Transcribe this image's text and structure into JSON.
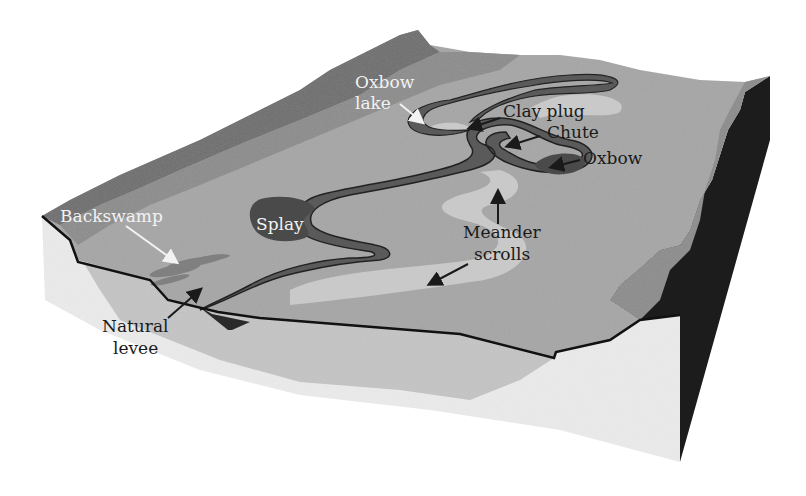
{
  "figure": {
    "labels": {
      "oxbow_lake_line1": "Oxbow",
      "oxbow_lake_line2": "lake",
      "clay_plug": "Clay plug",
      "chute": "Chute",
      "oxbow": "Oxbow",
      "backswamp": "Backswamp",
      "splay": "Splay",
      "meander_line1": "Meander",
      "meander_line2": "scrolls",
      "natural_line1": "Natural",
      "natural_line2": "levee"
    },
    "colors": {
      "background": "#ffffff",
      "valley_wall": "#6e6e6e",
      "floodplain_outer": "#8c8c8c",
      "floodplain": "#a6a6a6",
      "channel": "#5a5a5a",
      "point_bar": "#c9c9c9",
      "front_face": "#ebebeb",
      "front_face_mid": "#c4c4c4",
      "side_face": "#1c1c1c",
      "outline": "#111111"
    }
  }
}
